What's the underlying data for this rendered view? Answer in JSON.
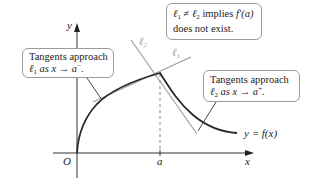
{
  "diagram": {
    "axes": {
      "y_label": "y",
      "x_label": "x",
      "origin_label": "O",
      "a_label": "a"
    },
    "curve_label": "y = f(x)",
    "tangent_labels": {
      "l1": "ℓ1",
      "l2": "ℓ2"
    },
    "callouts": {
      "left": {
        "line1": "Tangents approach",
        "line2_symbol": "ℓ",
        "line2_sub": "1",
        "line2_rest": " as x → a",
        "line2_sup": "−",
        "line2_end": "."
      },
      "top": {
        "line1_a": "ℓ",
        "line1_a_sub": "1",
        "line1_neq": " ≠ ",
        "line1_b": "ℓ",
        "line1_b_sub": "2",
        "line1_rest": " implies ",
        "line1_fprime": "f′(a)",
        "line2": "does not exist."
      },
      "right": {
        "line1": "Tangents approach",
        "line2_symbol": "ℓ",
        "line2_sub": "2",
        "line2_rest": " as x → a",
        "line2_sup": "+",
        "line2_end": "."
      }
    },
    "colors": {
      "curve": "#2a2a2a",
      "tangent": "#9a9a9a",
      "axis": "#333333",
      "callout_border": "#9a9a9a"
    }
  }
}
